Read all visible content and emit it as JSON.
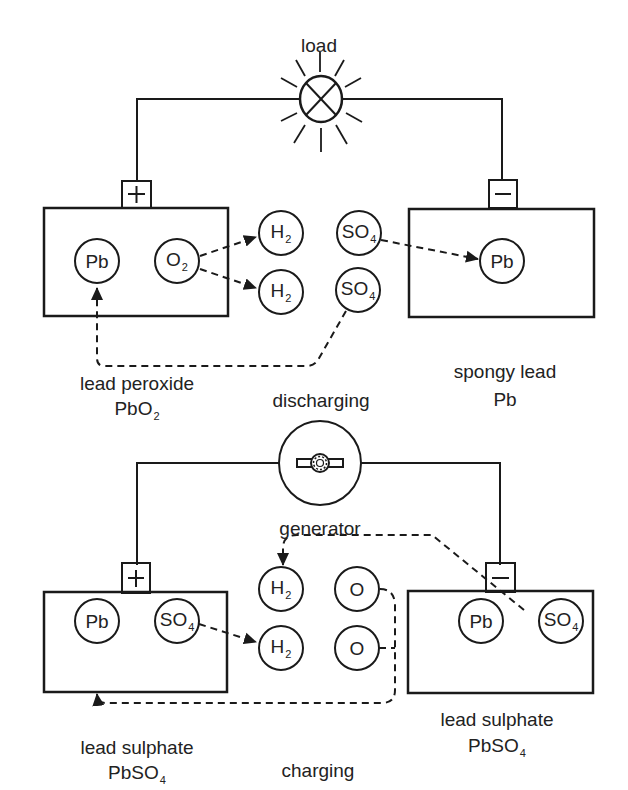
{
  "diagram": {
    "type": "lead-acid battery discharge/charge schematic",
    "colors": {
      "ink": "#1a1a1a",
      "background": "#ffffff"
    }
  },
  "discharging": {
    "title": "discharging",
    "load_label": "load",
    "load_icon": "lamp-icon",
    "positive_terminal": "+",
    "negative_terminal": "−",
    "positive_plate": {
      "ions": [
        {
          "base": "Pb",
          "sub": ""
        },
        {
          "base": "O",
          "sub": "2"
        }
      ],
      "label_line1": "lead peroxide",
      "label_line2_base": "PbO",
      "label_line2_sub": "2"
    },
    "electrolyte": {
      "ions": [
        {
          "base": "H",
          "sub": "2"
        },
        {
          "base": "H",
          "sub": "2"
        },
        {
          "base": "SO",
          "sub": "4"
        },
        {
          "base": "SO",
          "sub": "4"
        }
      ]
    },
    "negative_plate": {
      "ions": [
        {
          "base": "Pb",
          "sub": ""
        }
      ],
      "label_line1": "spongy lead",
      "label_line2_base": "Pb",
      "label_line2_sub": ""
    }
  },
  "charging": {
    "title": "charging",
    "source_label": "generator",
    "source_icon": "generator-icon",
    "positive_terminal": "+",
    "negative_terminal": "−",
    "positive_plate": {
      "ions": [
        {
          "base": "Pb",
          "sub": ""
        },
        {
          "base": "SO",
          "sub": "4"
        }
      ],
      "label_line1": "lead sulphate",
      "label_line2_base": "PbSO",
      "label_line2_sub": "4"
    },
    "electrolyte": {
      "ions": [
        {
          "base": "H",
          "sub": "2"
        },
        {
          "base": "H",
          "sub": "2"
        },
        {
          "base": "O",
          "sub": ""
        },
        {
          "base": "O",
          "sub": ""
        }
      ]
    },
    "negative_plate": {
      "ions": [
        {
          "base": "Pb",
          "sub": ""
        },
        {
          "base": "SO",
          "sub": "4"
        }
      ],
      "label_line1": "lead sulphate",
      "label_line2_base": "PbSO",
      "label_line2_sub": "4"
    }
  }
}
